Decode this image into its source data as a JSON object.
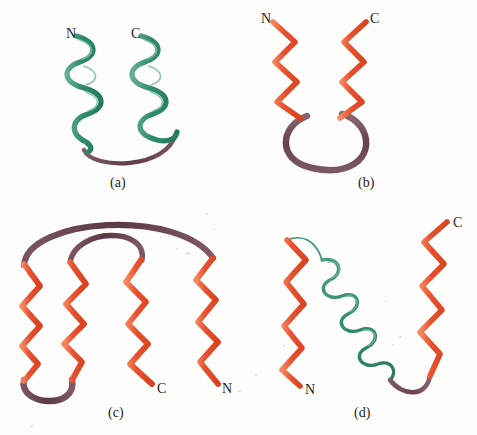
{
  "figure": {
    "background_color": "#fdfdfc",
    "kind": "protein-structure-motif-diagram",
    "panels": [
      {
        "id": "a",
        "caption": "(a)",
        "motif": "helix-loop-helix (antiparallel alpha-helix hairpin)",
        "elements": [
          {
            "type": "alpha-helix",
            "color": "#2f8a6c",
            "turns": 4.5,
            "orientation": "vertical"
          },
          {
            "type": "alpha-helix",
            "color": "#2f8a6c",
            "turns": 4.5,
            "orientation": "vertical"
          },
          {
            "type": "loop",
            "color": "#6d4954",
            "shape": "bottom-arc"
          }
        ],
        "labels": [
          {
            "text": "N",
            "terminus": "amino"
          },
          {
            "text": "C",
            "terminus": "carboxyl"
          }
        ]
      },
      {
        "id": "b",
        "caption": "(b)",
        "motif": "beta hairpin (two antiparallel beta strands)",
        "elements": [
          {
            "type": "beta-strand",
            "color": "#e8512f",
            "zigzags": 5,
            "orientation": "vertical"
          },
          {
            "type": "beta-strand",
            "color": "#e8512f",
            "zigzags": 5,
            "orientation": "vertical"
          },
          {
            "type": "loop",
            "color": "#6d4954",
            "shape": "oval-hairpin"
          }
        ],
        "labels": [
          {
            "text": "N",
            "terminus": "amino"
          },
          {
            "text": "C",
            "terminus": "carboxyl"
          }
        ]
      },
      {
        "id": "c",
        "caption": "(c)",
        "motif": "Greek key (four antiparallel beta strands)",
        "elements": [
          {
            "type": "beta-strand",
            "color": "#e8512f",
            "zigzags": 6,
            "orientation": "vertical"
          },
          {
            "type": "beta-strand",
            "color": "#e8512f",
            "zigzags": 6,
            "orientation": "vertical"
          },
          {
            "type": "beta-strand",
            "color": "#e8512f",
            "zigzags": 6,
            "orientation": "vertical"
          },
          {
            "type": "beta-strand",
            "color": "#e8512f",
            "zigzags": 6,
            "orientation": "vertical"
          },
          {
            "type": "loop",
            "color": "#6d4954",
            "shape": "outer-arc"
          },
          {
            "type": "loop",
            "color": "#6d4954",
            "shape": "inner-arc"
          },
          {
            "type": "loop",
            "color": "#6d4954",
            "shape": "bottom-u-turn"
          }
        ],
        "labels": [
          {
            "text": "C",
            "terminus": "carboxyl"
          },
          {
            "text": "N",
            "terminus": "amino"
          }
        ]
      },
      {
        "id": "d",
        "caption": "(d)",
        "motif": "beta-alpha-beta unit",
        "elements": [
          {
            "type": "beta-strand",
            "color": "#e8512f",
            "zigzags": 5,
            "orientation": "vertical"
          },
          {
            "type": "alpha-helix",
            "color": "#2f8a6c",
            "turns": 5,
            "orientation": "diagonal"
          },
          {
            "type": "beta-strand",
            "color": "#e8512f",
            "zigzags": 5,
            "orientation": "vertical"
          },
          {
            "type": "loop",
            "color": "#6d4954",
            "shape": "bottom-connector"
          }
        ],
        "labels": [
          {
            "text": "N",
            "terminus": "amino"
          },
          {
            "text": "C",
            "terminus": "carboxyl"
          }
        ]
      }
    ]
  },
  "colors": {
    "helix_green": "#2f8a6c",
    "helix_green_light": "#63ad96",
    "strand_orange": "#e8512f",
    "strand_orange_light": "#f47a52",
    "loop_purple": "#6d4954",
    "loop_purple_light": "#8a6a73",
    "label_ink": "#27211f",
    "page": "#fdfdfc"
  },
  "labels": {
    "panel_a": {
      "n_terminus": "N",
      "c_terminus": "C",
      "caption": "(a)"
    },
    "panel_b": {
      "n_terminus": "N",
      "c_terminus": "C",
      "caption": "(b)"
    },
    "panel_c": {
      "c_terminus": "C",
      "n_terminus": "N",
      "caption": "(c)"
    },
    "panel_d": {
      "n_terminus": "N",
      "c_terminus": "C",
      "caption": "(d)"
    }
  }
}
